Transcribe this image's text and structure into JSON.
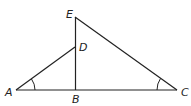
{
  "diagram": {
    "type": "geometry",
    "points": [
      {
        "id": "A",
        "label": "A",
        "x": 16,
        "y": 90
      },
      {
        "id": "B",
        "label": "B",
        "x": 76,
        "y": 90
      },
      {
        "id": "C",
        "label": "C",
        "x": 177,
        "y": 90
      },
      {
        "id": "D",
        "label": "D",
        "x": 75,
        "y": 47
      },
      {
        "id": "E",
        "label": "E",
        "x": 75,
        "y": 17
      }
    ],
    "segments": [
      [
        "A",
        "C"
      ],
      [
        "E",
        "B"
      ],
      [
        "E",
        "C"
      ],
      [
        "A",
        "D"
      ]
    ],
    "angle_marks": [
      "A",
      "C"
    ],
    "stroke_color": "#222222"
  }
}
